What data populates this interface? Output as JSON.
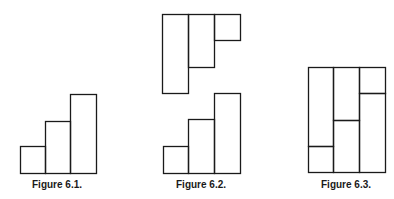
{
  "stroke_color": "#1a1a1a",
  "figures": [
    {
      "id": "figure-6-1",
      "caption": "Figure 6.1.",
      "caption_center_x": 57,
      "description": "Three adjacent bars in ascending staircase, bottom-aligned",
      "rects": [
        {
          "x": 20,
          "y": 146,
          "w": 25,
          "h": 27
        },
        {
          "x": 45,
          "y": 121,
          "w": 25,
          "h": 52
        },
        {
          "x": 70,
          "y": 94,
          "w": 26,
          "h": 79
        }
      ]
    },
    {
      "id": "figure-6-2",
      "caption": "Figure 6.2.",
      "caption_center_x": 201,
      "description": "Inverted descending staircase (top-aligned) above an ascending staircase (bottom-aligned); the two are complements",
      "rects": [
        {
          "x": 162,
          "y": 14,
          "w": 26,
          "h": 79
        },
        {
          "x": 188,
          "y": 14,
          "w": 26,
          "h": 53
        },
        {
          "x": 214,
          "y": 14,
          "w": 26,
          "h": 26
        },
        {
          "x": 163,
          "y": 146,
          "w": 25,
          "h": 27
        },
        {
          "x": 188,
          "y": 119,
          "w": 26,
          "h": 54
        },
        {
          "x": 214,
          "y": 93,
          "w": 26,
          "h": 80
        }
      ]
    },
    {
      "id": "figure-6-3",
      "caption": "Figure 6.3.",
      "caption_center_x": 346,
      "description": "The two staircases fitted together into a single rectangle of three columns",
      "rects": [
        {
          "x": 308,
          "y": 67,
          "w": 25,
          "h": 79
        },
        {
          "x": 308,
          "y": 146,
          "w": 25,
          "h": 26
        },
        {
          "x": 333,
          "y": 67,
          "w": 26,
          "h": 53
        },
        {
          "x": 333,
          "y": 120,
          "w": 26,
          "h": 52
        },
        {
          "x": 359,
          "y": 67,
          "w": 26,
          "h": 26
        },
        {
          "x": 359,
          "y": 93,
          "w": 26,
          "h": 79
        }
      ]
    }
  ]
}
